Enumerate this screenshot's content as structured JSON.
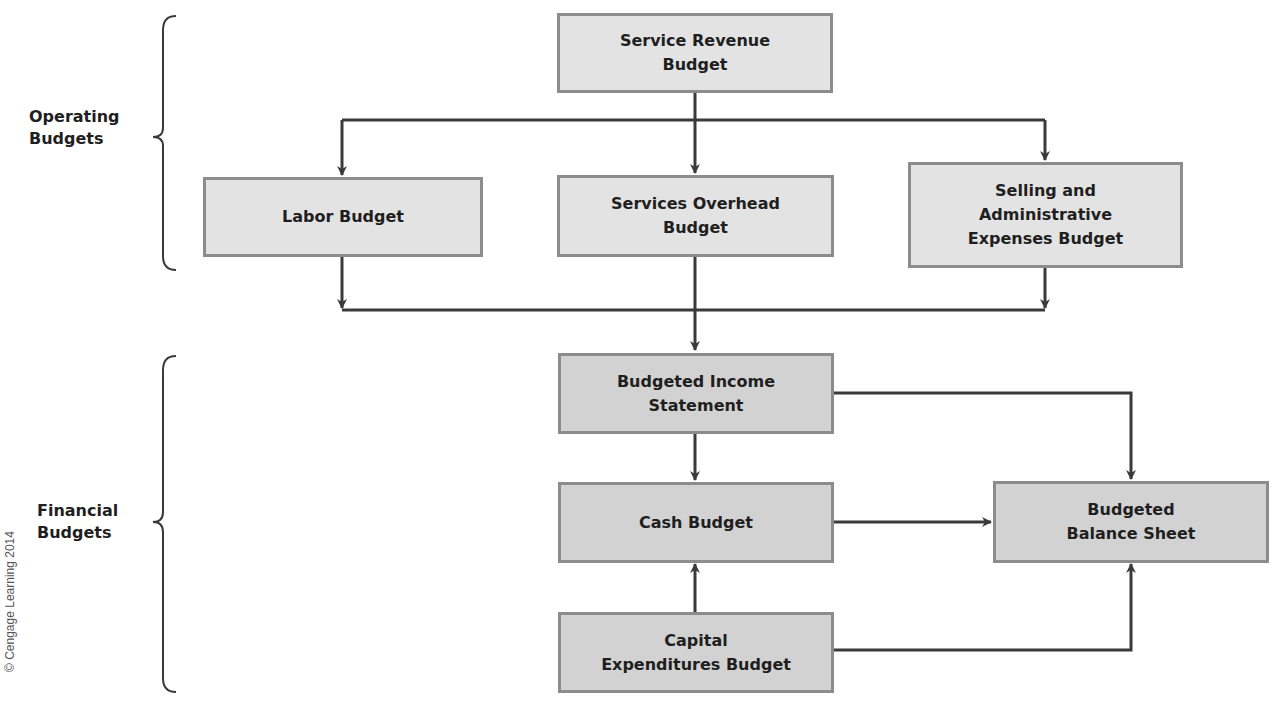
{
  "groups": {
    "operating": {
      "label": "Operating\nBudgets"
    },
    "financial": {
      "label": "Financial\nBudgets"
    }
  },
  "nodes": {
    "service_revenue": {
      "label": "Service Revenue\nBudget",
      "group": "operating"
    },
    "labor": {
      "label": "Labor Budget",
      "group": "operating"
    },
    "services_overhead": {
      "label": "Services Overhead\nBudget",
      "group": "operating"
    },
    "selling_admin": {
      "label": "Selling and\nAdministrative\nExpenses Budget",
      "group": "operating"
    },
    "income_statement": {
      "label": "Budgeted Income\nStatement",
      "group": "financial"
    },
    "cash": {
      "label": "Cash Budget",
      "group": "financial"
    },
    "capital": {
      "label": "Capital\nExpenditures Budget",
      "group": "financial"
    },
    "balance_sheet": {
      "label": "Budgeted\nBalance Sheet",
      "group": "financial"
    }
  },
  "edges": [
    {
      "from": "service_revenue",
      "to": "labor"
    },
    {
      "from": "service_revenue",
      "to": "services_overhead"
    },
    {
      "from": "service_revenue",
      "to": "selling_admin"
    },
    {
      "from": "labor",
      "to": "income_statement"
    },
    {
      "from": "services_overhead",
      "to": "income_statement"
    },
    {
      "from": "selling_admin",
      "to": "income_statement"
    },
    {
      "from": "income_statement",
      "to": "cash"
    },
    {
      "from": "income_statement",
      "to": "balance_sheet"
    },
    {
      "from": "cash",
      "to": "balance_sheet"
    },
    {
      "from": "capital",
      "to": "cash"
    },
    {
      "from": "capital",
      "to": "balance_sheet"
    }
  ],
  "colors": {
    "operating_fill": "#e3e3e3",
    "financial_fill": "#d2d2d2",
    "box_border": "#8c8c8c",
    "connector": "#3a3a3a"
  },
  "credit": "© Cengage Learning 2014"
}
